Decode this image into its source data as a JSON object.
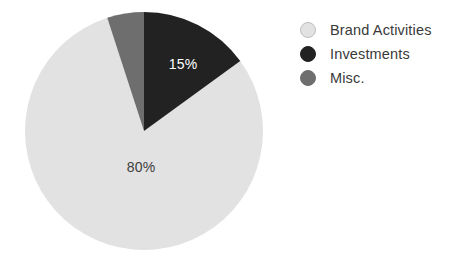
{
  "chart_data": {
    "type": "pie",
    "title": "",
    "subtitle": "",
    "xlabel": "",
    "ylabel": "",
    "grid": false,
    "legend_position": "right",
    "start_angle_deg": 0,
    "direction": "clockwise",
    "categories": [
      "Brand Activities",
      "Investments",
      "Misc."
    ],
    "values": [
      80,
      15,
      5
    ],
    "value_unit": "%",
    "colors": [
      "#e2e2e2",
      "#222222",
      "#6e6e6e"
    ],
    "slices": [
      {
        "name": "Brand Activities",
        "value": 80,
        "label": "80%",
        "label_shown": true,
        "color": "#e2e2e2",
        "label_color": "#3d3d3d",
        "start_deg": 54,
        "end_deg": 342
      },
      {
        "name": "Investments",
        "value": 15,
        "label": "15%",
        "label_shown": true,
        "color": "#222222",
        "label_color": "#ffffff",
        "start_deg": 0,
        "end_deg": 54
      },
      {
        "name": "Misc.",
        "value": 5,
        "label": "5%",
        "label_shown": false,
        "color": "#6e6e6e",
        "label_color": "#ffffff",
        "start_deg": 342,
        "end_deg": 360
      }
    ],
    "annotations": [
      {
        "text": "15%",
        "x": 183,
        "y": 65,
        "color": "#ffffff"
      },
      {
        "text": "80%",
        "x": 141,
        "y": 168,
        "color": "#3d3d3d"
      }
    ]
  },
  "pie": {
    "center_x": 144,
    "center_y": 131,
    "radius": 119,
    "label_investments": "15%",
    "label_brand": "80%"
  },
  "legend": {
    "items": [
      {
        "label": "Brand Activities",
        "color": "#e2e2e2",
        "border": "#bdbdbd",
        "swatch_name": "legend-swatch-brand-activities"
      },
      {
        "label": "Investments",
        "color": "#222222",
        "border": "#222222",
        "swatch_name": "legend-swatch-investments"
      },
      {
        "label": "Misc.",
        "color": "#6e6e6e",
        "border": "#6e6e6e",
        "swatch_name": "legend-swatch-misc"
      }
    ]
  }
}
